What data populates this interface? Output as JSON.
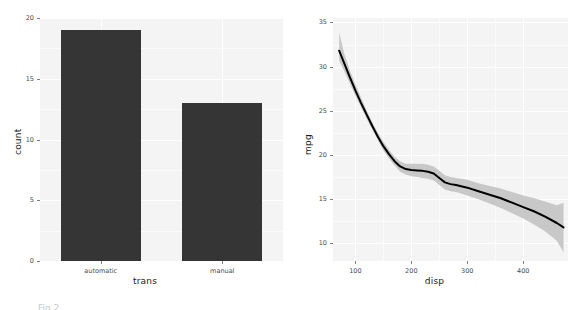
{
  "figure": {
    "caption_fragment": "Fig 2"
  },
  "chart_data": [
    {
      "type": "bar",
      "title": "",
      "xlabel": "trans",
      "ylabel": "count",
      "categories": [
        "automatic",
        "manual"
      ],
      "values": [
        19,
        13
      ],
      "ylim": [
        0,
        20
      ],
      "yticks": [
        0,
        5,
        10,
        15,
        20
      ],
      "ytick_labels": [
        "0",
        "5",
        "10",
        "15",
        "20"
      ],
      "xtick_labels": [
        "automatic",
        "manual"
      ],
      "grid": true,
      "legend": "none",
      "bar_color": "#353535",
      "panel_color": "#f4f4f4"
    },
    {
      "type": "line",
      "title": "",
      "xlabel": "disp",
      "ylabel": "mpg",
      "xlim": [
        60,
        480
      ],
      "ylim": [
        8,
        35.5
      ],
      "xticks": [
        100,
        200,
        300,
        400
      ],
      "xtick_labels": [
        "100",
        "200",
        "300",
        "400"
      ],
      "yticks": [
        10,
        15,
        20,
        25,
        30,
        35
      ],
      "ytick_labels": [
        "10",
        "15",
        "20",
        "25",
        "30",
        "35"
      ],
      "grid": true,
      "legend": "none",
      "line_color": "#000000",
      "band_color": "#c8c8c8",
      "panel_color": "#f4f4f4",
      "series": [
        {
          "name": "loess fit",
          "x": [
            71,
            80,
            90,
            100,
            110,
            120,
            130,
            140,
            150,
            160,
            170,
            180,
            190,
            200,
            210,
            220,
            230,
            240,
            250,
            260,
            270,
            280,
            300,
            320,
            340,
            360,
            380,
            400,
            420,
            440,
            460,
            472
          ],
          "y": [
            31.8,
            30.4,
            28.8,
            27.3,
            25.9,
            24.6,
            23.3,
            22.1,
            21.0,
            20.1,
            19.3,
            18.7,
            18.4,
            18.3,
            18.25,
            18.2,
            18.1,
            17.9,
            17.4,
            16.9,
            16.7,
            16.6,
            16.3,
            15.9,
            15.5,
            15.1,
            14.6,
            14.1,
            13.6,
            13.0,
            12.3,
            11.8
          ],
          "ymin": [
            30.7,
            29.5,
            28.1,
            26.7,
            25.4,
            24.1,
            22.9,
            21.7,
            20.5,
            19.6,
            18.8,
            18.1,
            17.8,
            17.6,
            17.5,
            17.4,
            17.3,
            17.1,
            16.6,
            16.1,
            15.9,
            15.8,
            15.4,
            15.0,
            14.5,
            14.0,
            13.4,
            12.8,
            12.1,
            11.3,
            10.3,
            9.0
          ],
          "ymax": [
            33.9,
            31.5,
            29.6,
            28.0,
            26.5,
            25.1,
            23.7,
            22.5,
            21.5,
            20.6,
            19.8,
            19.3,
            19.0,
            19.0,
            19.0,
            19.0,
            18.9,
            18.7,
            18.2,
            17.7,
            17.5,
            17.4,
            17.2,
            16.8,
            16.5,
            16.2,
            15.8,
            15.4,
            15.1,
            14.7,
            14.3,
            14.6
          ]
        }
      ]
    }
  ]
}
